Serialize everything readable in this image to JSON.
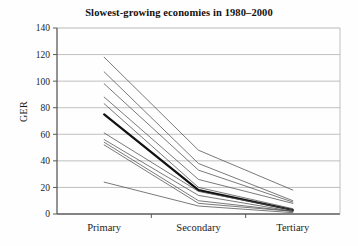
{
  "chart_data": {
    "type": "line",
    "title": "Slowest-growing economies in 1980–2000",
    "subtitle": "",
    "xlabel": "",
    "ylabel": "GER",
    "categories": [
      "Primary",
      "Secondary",
      "Tertiary"
    ],
    "x_tick_labels": [
      "Primary",
      "Secondary",
      "Tertiary"
    ],
    "y_tick_labels": [
      "0",
      "20",
      "40",
      "60",
      "80",
      "100",
      "120",
      "140"
    ],
    "y_ticks": [
      0,
      20,
      40,
      60,
      80,
      100,
      120,
      140
    ],
    "ylim": [
      0,
      140
    ],
    "grid": "horizontal",
    "legend": "none",
    "legend_position": "none",
    "annotations": [],
    "series": [
      {
        "name": "economy-1",
        "values": [
          118,
          48,
          18
        ],
        "emphasis": "normal"
      },
      {
        "name": "economy-2",
        "values": [
          107,
          38,
          10
        ],
        "emphasis": "normal"
      },
      {
        "name": "economy-3",
        "values": [
          98,
          33,
          9
        ],
        "emphasis": "normal"
      },
      {
        "name": "economy-4",
        "values": [
          88,
          26,
          8
        ],
        "emphasis": "normal"
      },
      {
        "name": "economy-5",
        "values": [
          83,
          20,
          4
        ],
        "emphasis": "normal"
      },
      {
        "name": "economy-6",
        "values": [
          75,
          18,
          3
        ],
        "emphasis": "bold"
      },
      {
        "name": "economy-7",
        "values": [
          61,
          17,
          3
        ],
        "emphasis": "normal"
      },
      {
        "name": "economy-8",
        "values": [
          56,
          14,
          2
        ],
        "emphasis": "normal"
      },
      {
        "name": "economy-9",
        "values": [
          54,
          10,
          2
        ],
        "emphasis": "normal"
      },
      {
        "name": "economy-10",
        "values": [
          52,
          8,
          2
        ],
        "emphasis": "normal"
      },
      {
        "name": "economy-11",
        "values": [
          24,
          6,
          1
        ],
        "emphasis": "normal"
      }
    ],
    "series_colors": {
      "normal": "#4d4d4d",
      "bold": "#111111"
    },
    "axis_color": "#5a5a5a",
    "grid_color": "#b9b9b9"
  }
}
